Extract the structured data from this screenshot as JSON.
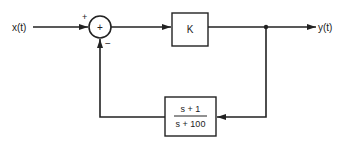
{
  "diagram": {
    "type": "feedback block diagram",
    "input_label": "x(t)",
    "output_label": "y(t)",
    "summer": {
      "symbol": "+",
      "input_sign": "+",
      "feedback_sign": "−"
    },
    "forward_block": {
      "label": "K"
    },
    "feedback_block": {
      "numerator": "s + 1",
      "denominator": "s + 100"
    }
  }
}
